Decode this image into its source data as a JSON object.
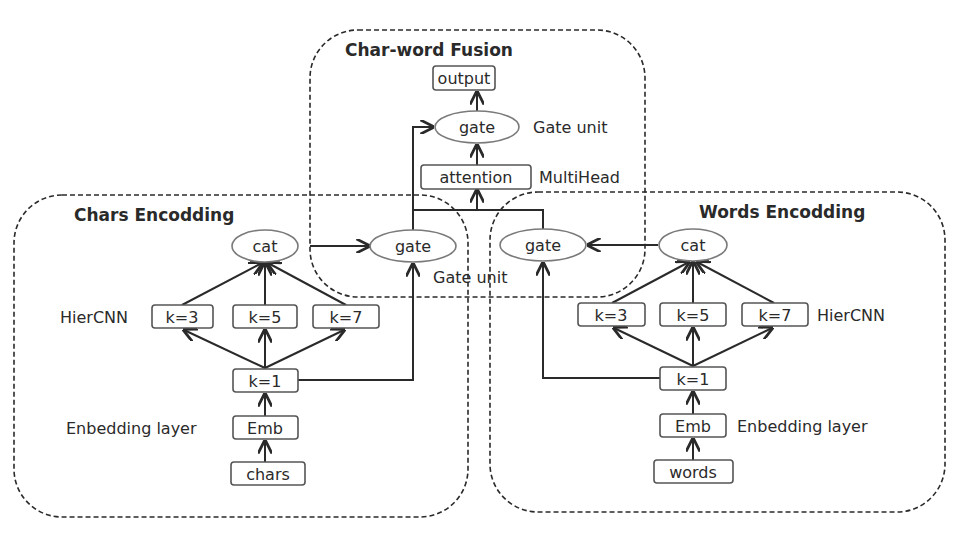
{
  "groups": {
    "fusion": {
      "title": "Char-word Fusion"
    },
    "chars": {
      "title": "Chars Encodding"
    },
    "words": {
      "title": "Words Encodding"
    }
  },
  "fusion": {
    "output": "output",
    "gate": "gate",
    "gate_label": "Gate unit",
    "attention": "attention",
    "attention_label": "MultiHead",
    "lower_gate_label": "Gate unit"
  },
  "chars": {
    "gate": "gate",
    "cat": "cat",
    "hiercnn_label": "HierCNN",
    "k3": "k=3",
    "k5": "k=5",
    "k7": "k=7",
    "k1": "k=1",
    "emb": "Emb",
    "emb_label": "Enbedding layer",
    "input": "chars"
  },
  "words": {
    "gate": "gate",
    "cat": "cat",
    "hiercnn_label": "HierCNN",
    "k3": "k=3",
    "k5": "k=5",
    "k7": "k=7",
    "k1": "k=1",
    "emb": "Emb",
    "emb_label": "Enbedding layer",
    "input": "words"
  },
  "colors": {
    "stroke": "#2a2a2a",
    "box_border": "#555555",
    "ellipse_border": "#7a7a7a",
    "background": "#ffffff"
  }
}
